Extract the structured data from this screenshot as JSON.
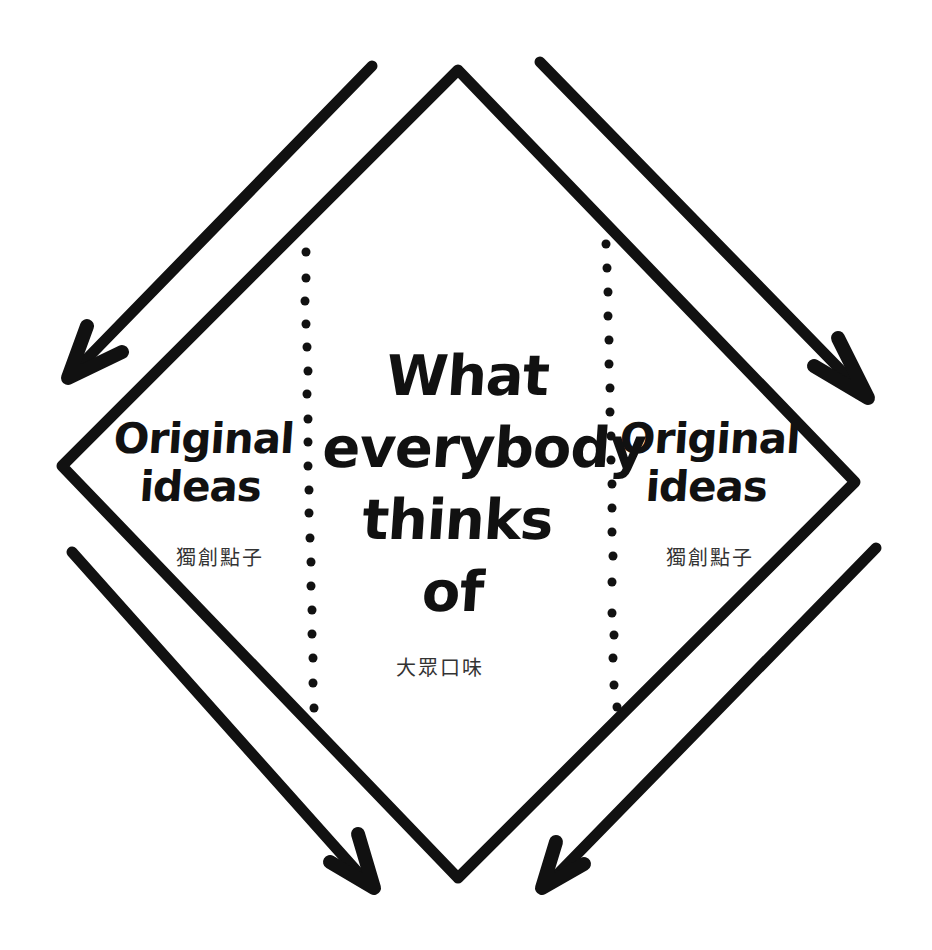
{
  "diagram": {
    "type": "hand-drawn concept diagram",
    "shape": "diamond",
    "colors": {
      "ink": "#111111",
      "subtext": "#333333",
      "background": "#ffffff"
    },
    "regions": {
      "left": {
        "title_lines": [
          "Original",
          "ideas"
        ],
        "subtitle": "獨創點子"
      },
      "center": {
        "title_lines": [
          "What",
          "everybody",
          "thinks",
          "of"
        ],
        "subtitle": "大眾口味"
      },
      "right": {
        "title_lines": [
          "Original",
          "ideas"
        ],
        "subtitle": "獨創點子"
      }
    },
    "dividers": [
      {
        "name": "left-dotted-divider",
        "style": "dotted"
      },
      {
        "name": "right-dotted-divider",
        "style": "dotted"
      }
    ],
    "arrows": [
      {
        "name": "top-left-arrow",
        "direction": "down-left",
        "points_to": "left region"
      },
      {
        "name": "top-right-arrow",
        "direction": "down-right",
        "points_to": "right region"
      },
      {
        "name": "bottom-left-arrow",
        "direction": "down-right",
        "points_to": "bottom vertex"
      },
      {
        "name": "bottom-right-arrow",
        "direction": "down-left",
        "points_to": "bottom vertex"
      }
    ]
  }
}
